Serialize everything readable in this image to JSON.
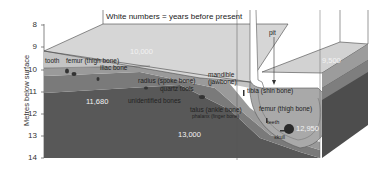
{
  "header": {
    "legend_note": "White numbers = years before present"
  },
  "axis": {
    "title": "Metres below surface",
    "ticks": [
      "8",
      "9",
      "10",
      "11",
      "12",
      "13",
      "14"
    ]
  },
  "annotations": {
    "pit": "pit"
  },
  "layer_ages": {
    "top_layer": "10,000",
    "right_block_top": "9,500",
    "middle_layer": "11,680",
    "lower_layer": "13,000",
    "pit_bottom": "12,950"
  },
  "finds": {
    "tooth": "tooth",
    "femur_left": "femur (thigh bone)",
    "iliac_bone": "iliac bone",
    "radius": "radius (spoke bone)",
    "quartz_tools": "quartz tools",
    "mandible": "mandible",
    "mandible_sub": "(jawbone)",
    "unidentified_bones": "unidentified bones",
    "tibia": "tibia (shin bone)",
    "talus": "talus (ankle bone)",
    "phalanx": "phalanx (finger bone)",
    "femur_right": "femur (thigh bone)",
    "teeth": "teeth",
    "skull": "skull"
  },
  "colors": {
    "top_surface": "#d4d4d4",
    "layer1": "#bdbdbd",
    "layer2": "#8c8c8c",
    "layer3": "#6a6a6a",
    "layer4": "#555555",
    "pit_fill": "#a8a8a8",
    "side_face": "#4a4a4a"
  }
}
